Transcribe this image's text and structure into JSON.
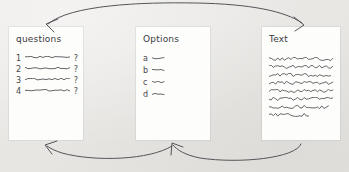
{
  "canvas": {
    "background_color": "#e9e8e6",
    "card_color": "#fdfdfc",
    "ink_color": "#55555a"
  },
  "cards": [
    {
      "id": "questions",
      "title": "questions",
      "rows": [
        {
          "marker": "1",
          "suffix": "?"
        },
        {
          "marker": "2",
          "suffix": "?"
        },
        {
          "marker": "3",
          "suffix": "?"
        },
        {
          "marker": "4",
          "suffix": "?"
        }
      ]
    },
    {
      "id": "options",
      "title": "Options",
      "rows": [
        {
          "marker": "a",
          "suffix": ""
        },
        {
          "marker": "b",
          "suffix": ""
        },
        {
          "marker": "c",
          "suffix": ""
        },
        {
          "marker": "d",
          "suffix": ""
        }
      ]
    },
    {
      "id": "text",
      "title": "Text",
      "line_count": 8
    }
  ],
  "arrows": [
    {
      "id": "questions-to-text",
      "label": "top double-headed arc",
      "from": "questions",
      "to": "text",
      "direction": "both"
    },
    {
      "id": "options-to-questions",
      "label": "bottom arc pointing left",
      "from": "options",
      "to": "questions",
      "direction": "left"
    },
    {
      "id": "text-to-options",
      "label": "bottom arc pointing left",
      "from": "text",
      "to": "options",
      "direction": "left"
    }
  ]
}
